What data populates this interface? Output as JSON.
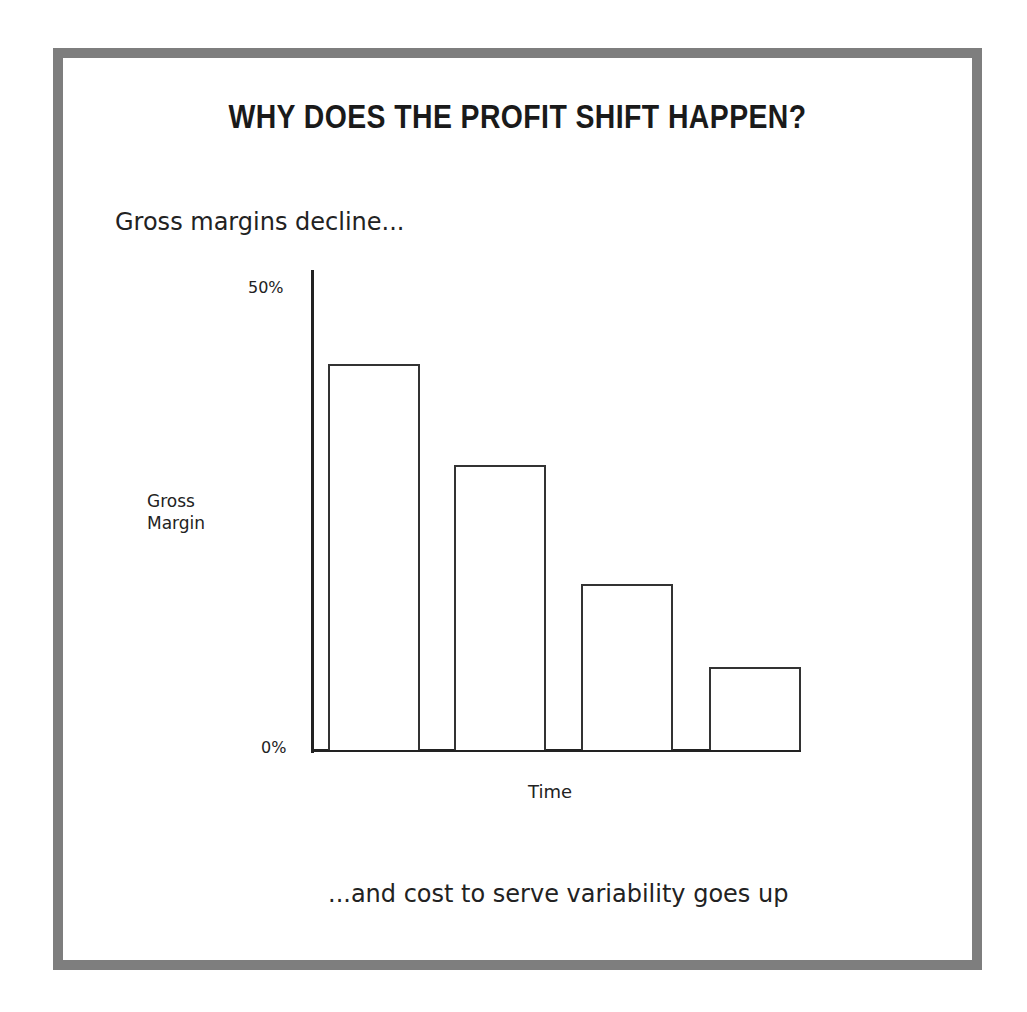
{
  "title": "WHY DOES THE PROFIT SHIFT HAPPEN?",
  "subtitle": "Gross margins decline...",
  "caption": "...and cost to serve variability goes up",
  "colors": {
    "frame": "#7e7e7e",
    "ink": "#222222",
    "background": "#ffffff"
  },
  "axes": {
    "y_label_line1": "Gross",
    "y_label_line2": "Margin",
    "y_tick_top": "50%",
    "y_tick_bottom": "0%",
    "x_label": "Time"
  },
  "chart_data": {
    "type": "bar",
    "title": "WHY DOES THE PROFIT SHIFT HAPPEN?",
    "subtitle": "Gross margins decline...",
    "annotation": "...and cost to serve variability goes up",
    "categories": [
      "T1",
      "T2",
      "T3",
      "T4"
    ],
    "values": [
      42,
      31,
      18,
      9
    ],
    "xlabel": "Time",
    "ylabel": "Gross Margin",
    "ylim": [
      0,
      50
    ],
    "yticks": [
      "0%",
      "50%"
    ],
    "grid": false,
    "legend": null,
    "bar_style": "outlined, no fill"
  }
}
